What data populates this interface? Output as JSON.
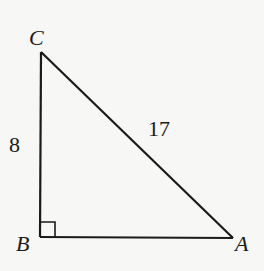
{
  "diagram": {
    "type": "right-triangle",
    "vertices": {
      "C": {
        "label": "C",
        "x": 41,
        "y": 52
      },
      "B": {
        "label": "B",
        "x": 40,
        "y": 237
      },
      "A": {
        "label": "A",
        "x": 233,
        "y": 238
      }
    },
    "sides": {
      "CB": {
        "label": "8"
      },
      "CA": {
        "label": "17"
      },
      "BA": {
        "label": ""
      }
    },
    "right_angle_at": "B",
    "stroke_color": "#1a1a1a",
    "background_color": "#f7f7f5"
  }
}
